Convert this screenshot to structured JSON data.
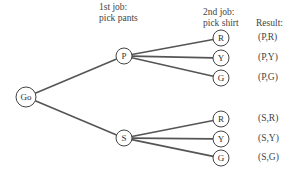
{
  "headers": {
    "first_job": [
      "1st job:",
      "pick pants"
    ],
    "second_job": [
      "2nd job:",
      "pick shirt"
    ],
    "result": "Result:"
  },
  "colors": {
    "line": "#555555",
    "node_stroke": "#444444",
    "text": "#444444",
    "background": "#ffffff"
  },
  "tree": {
    "root": {
      "label": "Go",
      "x": 26,
      "y": 97,
      "r": 10
    },
    "level1": [
      {
        "label": "P",
        "x": 124,
        "y": 56,
        "r": 8
      },
      {
        "label": "S",
        "x": 124,
        "y": 138,
        "r": 8
      }
    ],
    "level2": [
      {
        "parent": 0,
        "label": "R",
        "x": 221,
        "y": 38,
        "r": 8,
        "result": "(P,R)"
      },
      {
        "parent": 0,
        "label": "Y",
        "x": 221,
        "y": 58,
        "r": 8,
        "result": "(P,Y)"
      },
      {
        "parent": 0,
        "label": "G",
        "x": 221,
        "y": 78,
        "r": 8,
        "result": "(P,G)"
      },
      {
        "parent": 1,
        "label": "R",
        "x": 221,
        "y": 119,
        "r": 8,
        "result": "(S,R)"
      },
      {
        "parent": 1,
        "label": "Y",
        "x": 221,
        "y": 139,
        "r": 8,
        "result": "(S,Y)"
      },
      {
        "parent": 1,
        "label": "G",
        "x": 221,
        "y": 158,
        "r": 8,
        "result": "(S,G)"
      }
    ]
  }
}
